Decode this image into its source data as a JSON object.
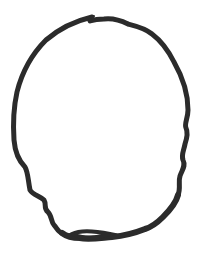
{
  "image": {
    "description": "Hand-drawn closed outline sketch, head-like shape",
    "stroke_color": "#2b2b2b",
    "background": "#ffffff"
  }
}
